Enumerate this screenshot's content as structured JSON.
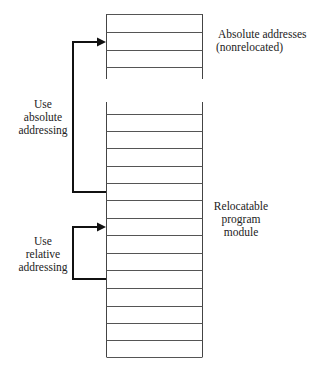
{
  "diagram": {
    "top_block": {
      "label_line1": "Absolute addresses",
      "label_line2": "(nonrelocated)",
      "rows": 4
    },
    "bottom_block": {
      "label_line1": "Relocatable",
      "label_line2": "program",
      "label_line3": "module",
      "rows": 14
    },
    "absolute_arrow": {
      "label_line1": "Use",
      "label_line2": "absolute",
      "label_line3": "addressing"
    },
    "relative_arrow": {
      "label_line1": "Use",
      "label_line2": "relative",
      "label_line3": "addressing"
    },
    "colors": {
      "line": "#555555",
      "arrow": "#111111",
      "text": "#222222"
    }
  }
}
